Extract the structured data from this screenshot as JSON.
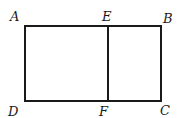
{
  "figure": {
    "stroke_color": "#1a1a1a",
    "background": "#ffffff",
    "rectangle": {
      "x1": 25,
      "y1": 26,
      "x2": 161,
      "y2": 101
    },
    "segment_EF": {
      "x": 108,
      "y1": 26,
      "y2": 101
    },
    "labels": {
      "A": "A",
      "E": "E",
      "B": "B",
      "D": "D",
      "F": "F",
      "C": "C"
    }
  }
}
